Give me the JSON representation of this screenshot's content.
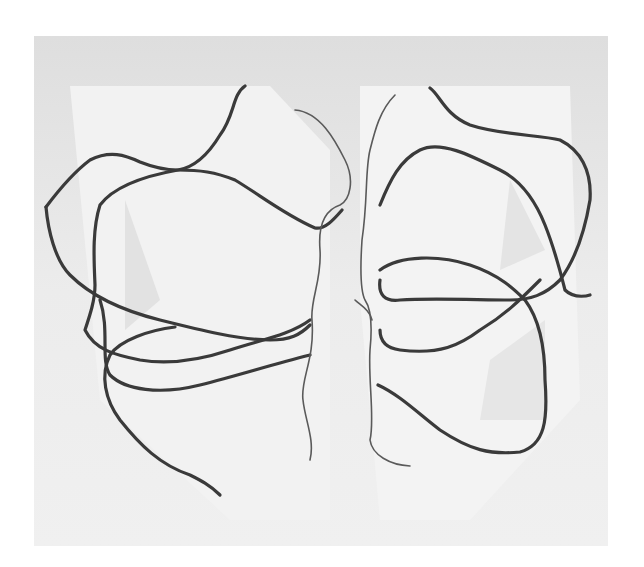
{
  "artwork": {
    "description": "Abstract line drawing of two clusters of overlapping wavy loops on a light gray panel",
    "colors": {
      "background": "#ffffff",
      "panel": "#e6e6e6",
      "panel_light": "#f1f1f1",
      "line": "#3a3a3a",
      "thin_line": "#5a5a5a"
    }
  }
}
